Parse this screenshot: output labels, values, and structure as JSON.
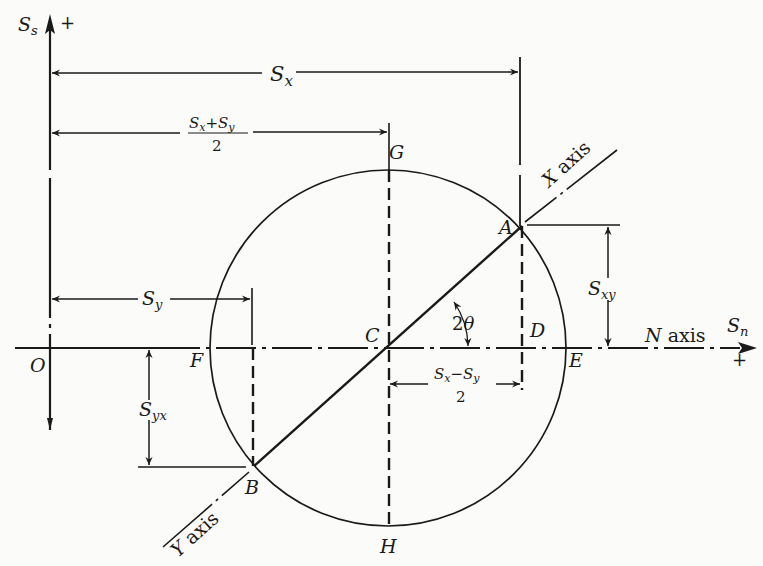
{
  "diagram": {
    "axes": {
      "vertical": {
        "symbol": "S",
        "subscript": "s",
        "sign": "+"
      },
      "horizontal": {
        "name": "N axis",
        "name_letter": "N",
        "name_word": "axis",
        "symbol": "S",
        "subscript": "n",
        "sign": "+"
      },
      "origin": "O"
    },
    "points": {
      "A": "A",
      "B": "B",
      "C": "C",
      "D": "D",
      "E": "E",
      "F": "F",
      "G": "G",
      "H": "H"
    },
    "rotated_axes": {
      "x_axis": {
        "letter": "X",
        "word": "axis"
      },
      "y_axis": {
        "letter": "Y",
        "word": "axis"
      }
    },
    "dimensions": {
      "sx": {
        "symbol": "S",
        "subscript": "x"
      },
      "mean": {
        "num_s1": "S",
        "num_sub1": "x",
        "op": "+",
        "num_s2": "S",
        "num_sub2": "y",
        "denominator": "2"
      },
      "sy": {
        "symbol": "S",
        "subscript": "y"
      },
      "sxy": {
        "symbol": "S",
        "subscript": "xy"
      },
      "syx": {
        "symbol": "S",
        "subscript": "yx"
      },
      "half_diff": {
        "num_s1": "S",
        "num_sub1": "x",
        "op": "−",
        "num_s2": "S",
        "num_sub2": "y",
        "denominator": "2"
      },
      "angle": {
        "coef": "2",
        "symbol": "θ"
      }
    }
  }
}
